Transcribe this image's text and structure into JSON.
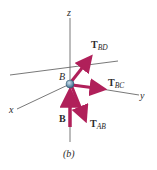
{
  "figure": {
    "caption": "(b)",
    "point_label": "B",
    "axes": {
      "x": "x",
      "y": "y",
      "z": "z"
    },
    "forces": [
      {
        "id": "T_BD",
        "main": "T",
        "sub": "BD",
        "direction": "up-right"
      },
      {
        "id": "T_BC",
        "main": "T",
        "sub": "BC",
        "direction": "right"
      },
      {
        "id": "T_AB",
        "main": "T",
        "sub": "AB",
        "direction": "down-right"
      },
      {
        "id": "B",
        "main": "B",
        "sub": "",
        "direction": "up"
      }
    ],
    "colors": {
      "arrow": "#b0205a",
      "axis": "#444444",
      "node": "#5b8fb0"
    }
  }
}
